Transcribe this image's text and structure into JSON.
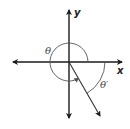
{
  "diagram": {
    "type": "angle-in-standard-position",
    "labels": {
      "x_axis": "x",
      "y_axis": "y",
      "angle": "θ",
      "reference_angle": "θ′"
    },
    "colors": {
      "axes": "#1a1a1a",
      "arcs": "#555555",
      "ray": "#333333",
      "background": "#ffffff"
    },
    "geometry": {
      "origin": [
        69,
        62
      ],
      "terminal_ray_end": [
        100,
        116
      ],
      "theta_arc_radius": 19,
      "reference_arc_radius": 36
    }
  }
}
